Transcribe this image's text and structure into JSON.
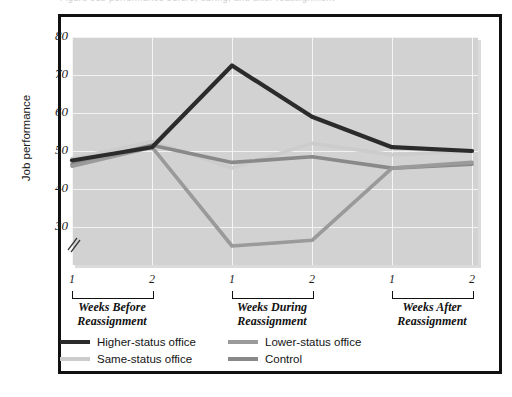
{
  "figure": {
    "cut_off_caption": "Figure   Job performance before, during, and after reassignment"
  },
  "chart_data": {
    "type": "line",
    "title": "",
    "xlabel": "",
    "ylabel": "Job performance",
    "ylim": [
      30,
      80
    ],
    "yticks": [
      30,
      40,
      50,
      60,
      70,
      80
    ],
    "axis_break": true,
    "grid": true,
    "legend_position": "bottom",
    "x": [
      1,
      2,
      1,
      2,
      1,
      2
    ],
    "x_tick_labels": [
      "1",
      "2",
      "1",
      "2",
      "1",
      "2"
    ],
    "x_groups": [
      {
        "label_line1": "Weeks Before",
        "label_line2": "Reassignment"
      },
      {
        "label_line1": "Weeks During",
        "label_line2": "Reassignment"
      },
      {
        "label_line1": "Weeks After",
        "label_line2": "Reassignment"
      }
    ],
    "series": [
      {
        "name": "Higher-status office",
        "color": "#2b2b2b",
        "values": [
          47.5,
          51.0,
          72.5,
          59.0,
          51.0,
          50.0
        ]
      },
      {
        "name": "Same-status office",
        "color": "#cccccc",
        "values": [
          48.0,
          52.5,
          45.5,
          52.0,
          49.0,
          50.0
        ]
      },
      {
        "name": "Lower-status office",
        "color": "#9a9a9a",
        "values": [
          46.0,
          51.0,
          25.0,
          26.5,
          45.5,
          47.0
        ]
      },
      {
        "name": "Control",
        "color": "#898989",
        "values": [
          46.5,
          51.5,
          47.0,
          48.5,
          45.5,
          46.5
        ]
      }
    ]
  },
  "legend": {
    "items": [
      {
        "label": "Higher-status office",
        "color": "#2b2b2b"
      },
      {
        "label": "Same-status office",
        "color": "#cccccc"
      },
      {
        "label": "Lower-status office",
        "color": "#9a9a9a"
      },
      {
        "label": "Control",
        "color": "#898989"
      }
    ]
  }
}
